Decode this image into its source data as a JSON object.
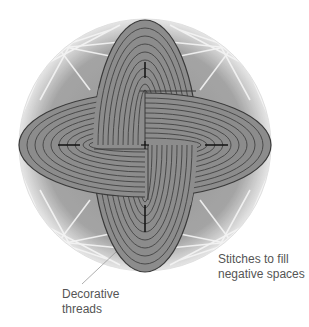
{
  "figure": {
    "colors": {
      "background": "#ffffff",
      "ball_base": "#9a9a9a",
      "ball_light": "#d9d9d9",
      "thread_white": "#f4f4f4",
      "band_fill": "#8c8c8c",
      "band_stripe": "#4a4a4a",
      "band_outline": "#3a3a3a",
      "center_mark": "#111111",
      "leader_line": "#999999",
      "label_text": "#555555"
    }
  },
  "labels": {
    "stitches": {
      "line1": "Stitches to fill",
      "line2": "negative spaces"
    },
    "decorative": {
      "line1": "Decorative",
      "line2": "threads"
    }
  }
}
